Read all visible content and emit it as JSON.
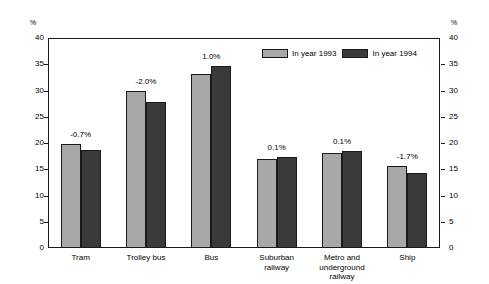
{
  "chart_data": {
    "type": "bar",
    "title": "",
    "xlabel": "",
    "ylabel": "%",
    "ylabel_right": "%",
    "ylim": [
      0,
      40
    ],
    "yticks": [
      0,
      5,
      10,
      15,
      20,
      25,
      30,
      35,
      40
    ],
    "grid": false,
    "legend_position": "top-center",
    "categories": [
      "Tram",
      "Trolley bus",
      "Bus",
      "Suburban\nrailway",
      "Metro and\nunderground\nrailway",
      "Ship"
    ],
    "category_lines": [
      [
        "Tram"
      ],
      [
        "Trolley bus"
      ],
      [
        "Bus"
      ],
      [
        "Suburban",
        "railway"
      ],
      [
        "Metro and",
        "underground",
        "railway"
      ],
      [
        "Ship"
      ]
    ],
    "series": [
      {
        "name": "In year 1993",
        "color": "#a8a8a8",
        "values": [
          19.8,
          30.0,
          33.2,
          17.0,
          18.1,
          15.7
        ]
      },
      {
        "name": "In year 1994",
        "color": "#3a3a3a",
        "values": [
          18.6,
          27.9,
          34.6,
          17.3,
          18.5,
          14.2
        ]
      }
    ],
    "annotations": [
      "-0.7%",
      "-2.0%",
      "1.0%",
      "0.1%",
      "0.1%",
      "-1.7%"
    ]
  },
  "colors": {
    "series_1993": "#a8a8a8",
    "series_1994": "#3a3a3a",
    "axis": "#1a1a1a",
    "background": "#ffffff"
  }
}
